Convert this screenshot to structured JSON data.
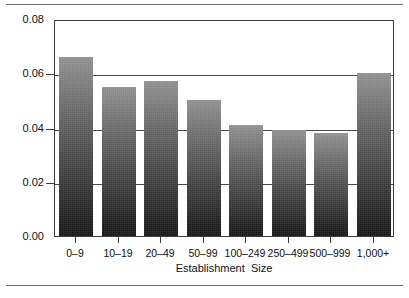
{
  "chart_data": {
    "type": "bar",
    "title": "",
    "subtitle": "",
    "xlabel": "Establishment  Size",
    "ylabel": "",
    "categories": [
      "0–9",
      "10–19",
      "20–49",
      "50–99",
      "100–249",
      "250–499",
      "500–999",
      "1,000+"
    ],
    "values": [
      0.066,
      0.055,
      0.057,
      0.05,
      0.041,
      0.039,
      0.038,
      0.06
    ],
    "ylim": [
      0.0,
      0.08
    ],
    "ytick_labels": [
      "0.00",
      "0.02",
      "0.04",
      "0.06",
      "0.08"
    ],
    "ytick_values": [
      0.0,
      0.02,
      0.04,
      0.06,
      0.08
    ],
    "grid": "horizontal",
    "legend": "none",
    "series": [
      {
        "name": "",
        "values": [
          0.066,
          0.055,
          0.057,
          0.05,
          0.041,
          0.039,
          0.038,
          0.06
        ]
      }
    ],
    "colors": {
      "bar_gradient_top": "#8e8e8e",
      "bar_gradient_bottom": "#141414",
      "axis": "#3c3c3c",
      "gridline": "#4a4a4a",
      "background": "#ffffff",
      "rule": "#6d6d6d",
      "text": "#111111"
    }
  },
  "figure": {
    "rule_top_label": "top-rule",
    "rule_bottom_label": "bottom-rule"
  }
}
